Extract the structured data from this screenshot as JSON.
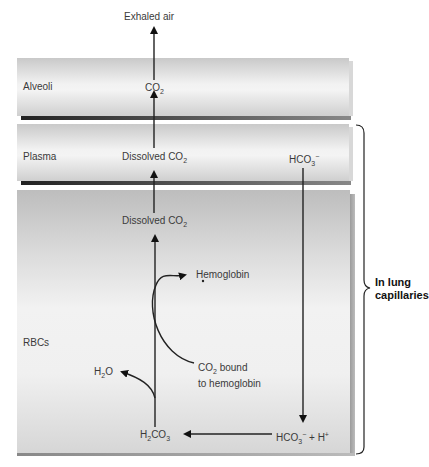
{
  "regions": {
    "alveoli": "Alveoli",
    "plasma": "Plasma",
    "rbcs": "RBCs"
  },
  "labels": {
    "exhaled_air": "Exhaled air",
    "alveoli_co2": {
      "main": "CO",
      "sub": "2"
    },
    "plasma_dissolved_co2": {
      "main": "Dissolved CO",
      "sub": "2"
    },
    "plasma_hco3": {
      "main": "HCO",
      "sub": "3",
      "sup": "−"
    },
    "rbc_dissolved_co2": {
      "main": "Dissolved CO",
      "sub": "2"
    },
    "hemoglobin": "Hemoglobin",
    "co2_bound": {
      "line1_main": "CO",
      "line1_sub": "2",
      "line1_rest": " bound",
      "line2": "to hemoglobin"
    },
    "h2o": {
      "a": "H",
      "sub": "2",
      "b": "O"
    },
    "h2co3": {
      "a": "H",
      "sub1": "2",
      "b": "CO",
      "sub2": "3"
    },
    "hco3_h": {
      "main": "HCO",
      "sub": "3",
      "sup": "−",
      "rest": " + H",
      "sup2": "+"
    }
  },
  "bracket": {
    "line1": "In lung",
    "line2": "capillaries"
  }
}
